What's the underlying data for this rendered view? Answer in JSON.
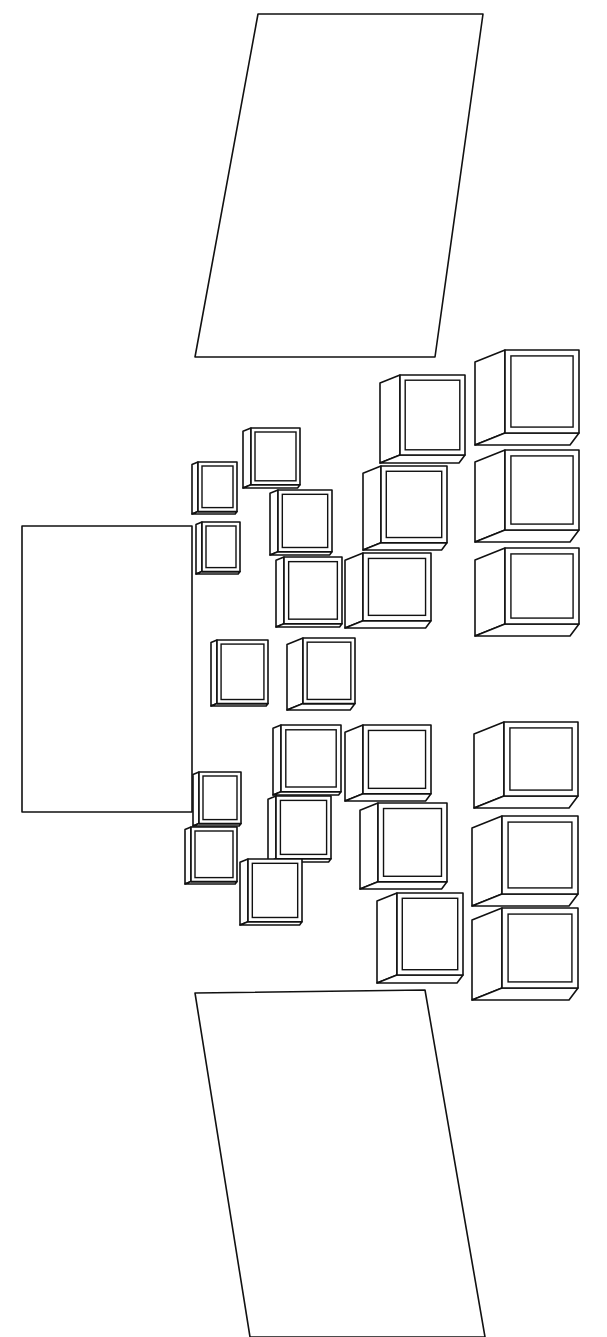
{
  "diagram": {
    "stroke_color": "#111111",
    "background": "#ffffff",
    "shapes": {
      "top_panel": {
        "points": "258,14 483,14 435,357 195,357"
      },
      "bottom_panel": {
        "points": "195,993 425,990 485,1337 250,1337"
      },
      "center_rect": {
        "x": 22,
        "y": 526,
        "w": 170,
        "h": 286
      },
      "boxes": [
        {
          "x": 192,
          "y": 462,
          "w": 45,
          "h": 52,
          "d": 6
        },
        {
          "x": 196,
          "y": 522,
          "w": 44,
          "h": 52,
          "d": 6
        },
        {
          "x": 243,
          "y": 428,
          "w": 57,
          "h": 60,
          "d": 8
        },
        {
          "x": 270,
          "y": 490,
          "w": 62,
          "h": 65,
          "d": 8
        },
        {
          "x": 276,
          "y": 557,
          "w": 66,
          "h": 70,
          "d": 8
        },
        {
          "x": 345,
          "y": 553,
          "w": 86,
          "h": 75,
          "d": 18
        },
        {
          "x": 363,
          "y": 466,
          "w": 84,
          "h": 84,
          "d": 18
        },
        {
          "x": 380,
          "y": 375,
          "w": 85,
          "h": 88,
          "d": 20
        },
        {
          "x": 475,
          "y": 350,
          "w": 104,
          "h": 95,
          "d": 30
        },
        {
          "x": 475,
          "y": 450,
          "w": 104,
          "h": 92,
          "d": 30
        },
        {
          "x": 475,
          "y": 548,
          "w": 104,
          "h": 88,
          "d": 30
        },
        {
          "x": 211,
          "y": 640,
          "w": 57,
          "h": 66,
          "d": 6
        },
        {
          "x": 287,
          "y": 638,
          "w": 68,
          "h": 72,
          "d": 16
        },
        {
          "x": 273,
          "y": 725,
          "w": 68,
          "h": 70,
          "d": 8
        },
        {
          "x": 345,
          "y": 725,
          "w": 86,
          "h": 76,
          "d": 18
        },
        {
          "x": 474,
          "y": 722,
          "w": 104,
          "h": 86,
          "d": 30
        },
        {
          "x": 193,
          "y": 772,
          "w": 48,
          "h": 54,
          "d": 6
        },
        {
          "x": 185,
          "y": 827,
          "w": 52,
          "h": 57,
          "d": 6
        },
        {
          "x": 268,
          "y": 796,
          "w": 63,
          "h": 66,
          "d": 8
        },
        {
          "x": 240,
          "y": 859,
          "w": 62,
          "h": 66,
          "d": 8
        },
        {
          "x": 360,
          "y": 803,
          "w": 87,
          "h": 86,
          "d": 18
        },
        {
          "x": 377,
          "y": 893,
          "w": 86,
          "h": 90,
          "d": 20
        },
        {
          "x": 472,
          "y": 816,
          "w": 106,
          "h": 90,
          "d": 30
        },
        {
          "x": 472,
          "y": 908,
          "w": 106,
          "h": 92,
          "d": 30
        }
      ]
    }
  }
}
